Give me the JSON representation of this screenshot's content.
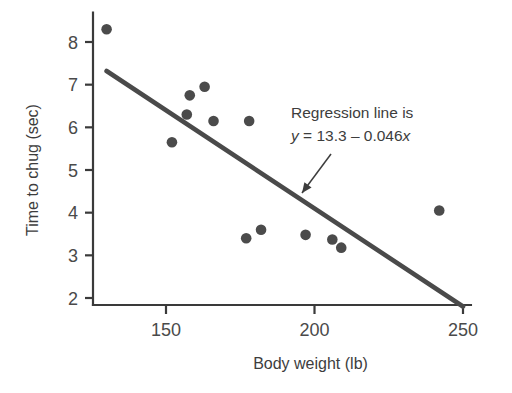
{
  "chart_data": {
    "type": "scatter",
    "title": "",
    "xlabel": "Body weight (lb)",
    "ylabel": "Time to chug (sec)",
    "xlim": [
      128,
      252
    ],
    "ylim": [
      1.85,
      8.55
    ],
    "xticks": [
      150,
      200,
      250
    ],
    "xtick_labels": [
      "150",
      "200",
      "250"
    ],
    "yticks": [
      2,
      3,
      4,
      5,
      6,
      7,
      8
    ],
    "ytick_labels": [
      "2",
      "3",
      "4",
      "5",
      "6",
      "7",
      "8"
    ],
    "grid": false,
    "legend": "none",
    "marker_color": "#4b4b4b",
    "line_color": "#4a4a4a",
    "axis_color": "#3a3a3a",
    "points": [
      {
        "x": 130,
        "y": 8.3
      },
      {
        "x": 152,
        "y": 5.65
      },
      {
        "x": 157,
        "y": 6.3
      },
      {
        "x": 158,
        "y": 6.75
      },
      {
        "x": 163,
        "y": 6.95
      },
      {
        "x": 166,
        "y": 6.15
      },
      {
        "x": 178,
        "y": 6.15
      },
      {
        "x": 177,
        "y": 3.4
      },
      {
        "x": 182,
        "y": 3.6
      },
      {
        "x": 197,
        "y": 3.48
      },
      {
        "x": 206,
        "y": 3.37
      },
      {
        "x": 209,
        "y": 3.18
      },
      {
        "x": 242,
        "y": 4.05
      }
    ],
    "regression": {
      "intercept": 13.3,
      "slope": -0.046,
      "x_start": 130,
      "x_end": 250,
      "equation_label": "Regression line is",
      "equation_y": "y",
      "equation_body": " = 13.3 – 0.046",
      "equation_x": "x"
    },
    "annotation": {
      "line1": "Regression line is",
      "line2_y": "y",
      "line2_mid": " = 13.3 – 0.046",
      "line2_x": "x",
      "arrow_from": [
        331,
        154
      ],
      "arrow_to": [
        302,
        193
      ]
    }
  }
}
